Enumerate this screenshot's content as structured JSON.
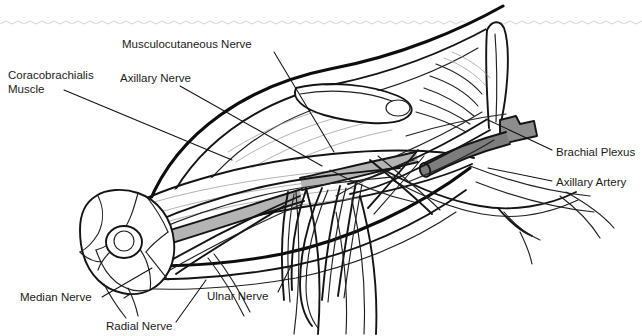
{
  "figure": {
    "orientation": "Right upper limb, anterior view, arm abducted",
    "background_color": "#ffffff",
    "ink_color": "#111111",
    "artery_shade_color": "#7d7d7d",
    "hatch_color": "#9a9a9a"
  },
  "labels": [
    {
      "id": "musculocutaneous-nerve",
      "text": "Musculocutaneous Nerve",
      "text_x": 122,
      "text_y": 48,
      "anchor": "start",
      "leader": "M 274 52 L 334 152",
      "target_structure": "nerve piercing coracobrachialis"
    },
    {
      "id": "coracobrachialis-muscle",
      "text_line_1": "Coracobrachialis",
      "text_line_2": "Muscle",
      "text_x": 8,
      "text_y": 79,
      "text_y2": 93,
      "anchor": "start",
      "leader": "M 64 90 L 232 160",
      "target_structure": "coracobrachialis muscle belly"
    },
    {
      "id": "axillary-nerve",
      "text": "Axillary Nerve",
      "text_x": 120,
      "text_y": 82,
      "anchor": "start",
      "leader": "M 180 86 L 322 166",
      "target_structure": "axillary nerve at quadrangular space"
    },
    {
      "id": "brachial-plexus",
      "text": "Brachial Plexus",
      "text_x": 556,
      "text_y": 156,
      "anchor": "start",
      "leader": "M 552 150 L 486 119",
      "target_structure": "cords of brachial plexus"
    },
    {
      "id": "axillary-artery",
      "text": "Axillary Artery",
      "text_x": 556,
      "text_y": 186,
      "anchor": "start",
      "leader": "M 552 181 L 488 168",
      "target_structure": "axillary artery trunk"
    },
    {
      "id": "median-nerve",
      "text": "Median Nerve",
      "text_x": 20,
      "text_y": 301,
      "anchor": "start",
      "leader": "M 102 297 L 152 268",
      "target_structure": "median nerve in arm"
    },
    {
      "id": "radial-nerve",
      "text": "Radial Nerve",
      "text_x": 106,
      "text_y": 330,
      "anchor": "start",
      "leader": "M 176 322 L 206 280",
      "target_structure": "radial nerve posterior"
    },
    {
      "id": "ulnar-nerve",
      "text": "Ulnar Nerve",
      "text_x": 207,
      "text_y": 300,
      "anchor": "start",
      "leader": "M 278 292 L 292 264",
      "target_structure": "ulnar nerve medial"
    }
  ],
  "structures": {
    "humerus_cut_end": "cross-sectioned proximal arm with muscle compartments",
    "scapula_spine": "scapular spine and acromion at upper right",
    "clavicle": "clavicle shading at upper right",
    "nerve_branches_count": 9,
    "artery_segments": 3
  }
}
